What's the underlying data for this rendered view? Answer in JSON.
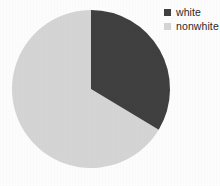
{
  "chart_data": {
    "type": "pie",
    "title": "",
    "subtitle": "",
    "xlabel": "",
    "ylabel": "",
    "grid": false,
    "legend_position": "top-right",
    "categories": [
      "white",
      "nonwhite"
    ],
    "values": [
      34,
      66
    ],
    "value_unit": "percent",
    "slices": [
      {
        "label": "white",
        "value": 34,
        "color": "#404040",
        "start_angle_deg": 0,
        "end_angle_deg": 121
      },
      {
        "label": "nonwhite",
        "value": 66,
        "color": "#d5d5d5",
        "start_angle_deg": 121,
        "end_angle_deg": 360
      }
    ],
    "start_angle_deg": 0,
    "direction": "clockwise",
    "geometry": {
      "center_x": 91,
      "center_y": 89,
      "radius": 79
    }
  },
  "legend": {
    "items": [
      {
        "label": "white",
        "color": "#404040",
        "swatch_name": "legend-swatch-white"
      },
      {
        "label": "nonwhite",
        "color": "#d5d5d5",
        "swatch_name": "legend-swatch-nonwhite"
      }
    ]
  },
  "colors": {
    "background": "#fdfdfd",
    "slice_dark": "#404040",
    "slice_light": "#d5d5d5",
    "text": "#2a2a2a"
  }
}
